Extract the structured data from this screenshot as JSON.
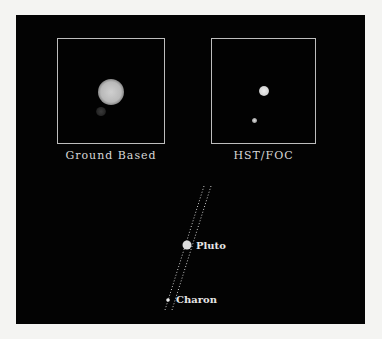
{
  "figure": {
    "panels": [
      {
        "id": "ground",
        "caption": "Ground Based"
      },
      {
        "id": "hst",
        "caption": "HST/FOC"
      }
    ],
    "diagram": {
      "labels": {
        "pluto": "Pluto",
        "charon": "Charon"
      }
    }
  },
  "colors": {
    "page_background": "#f4f4f2",
    "panel_background": "#030303",
    "frame_border": "#bdbdbd",
    "text": "#d8d8d8"
  }
}
